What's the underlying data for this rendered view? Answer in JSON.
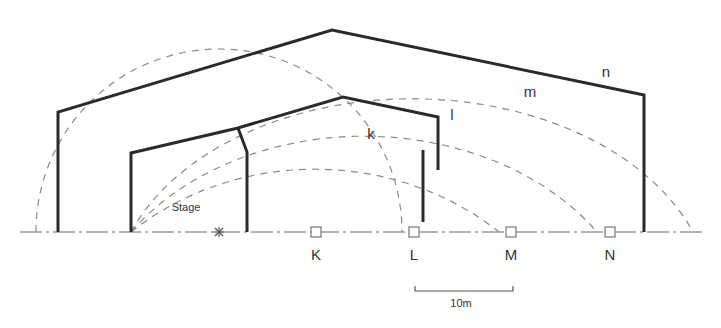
{
  "diagram": {
    "type": "section-drawing",
    "stage_label": "Stage",
    "source_symbol": "*",
    "receivers": [
      {
        "label": "K",
        "x": 316
      },
      {
        "label": "L",
        "x": 414
      },
      {
        "label": "M",
        "x": 511
      },
      {
        "label": "N",
        "x": 610
      }
    ],
    "arcs": [
      {
        "label": "k",
        "radius": 183
      },
      {
        "label": "l",
        "radius": 280
      },
      {
        "label": "m",
        "radius": 378
      },
      {
        "label": "n",
        "radius": 474
      }
    ],
    "scale_bar": {
      "label": "10m"
    },
    "colors": {
      "wall": "#2a2a2a",
      "arc": "#8a8a8a",
      "ground": "#6a6a6a",
      "text": "#333333"
    }
  }
}
